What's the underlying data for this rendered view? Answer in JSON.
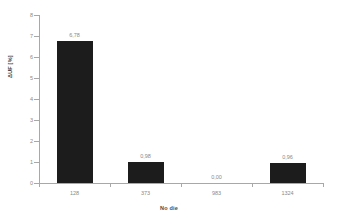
{
  "chart_data": {
    "type": "bar",
    "title": "",
    "subtitle": "",
    "xlabel": "No die",
    "ylabel": "ΔUF [%]",
    "categories": [
      "128",
      "373",
      "983",
      "1324"
    ],
    "values": [
      6.78,
      0.98,
      0.0,
      0.96
    ],
    "data_labels": [
      "6,78",
      "0,98",
      "0,00",
      "0,96"
    ],
    "ylim": [
      0,
      8
    ],
    "yticks": [
      0,
      1,
      2,
      3,
      4,
      5,
      6,
      7,
      8
    ],
    "ytick_labels": [
      "0",
      "1",
      "2",
      "3",
      "4",
      "5",
      "6",
      "7",
      "8"
    ],
    "grid": false,
    "legend": null,
    "legend_position": "none",
    "decimal_separator": ",",
    "bar_color": "#1c1c1c",
    "axis_color": "#a8a8a8",
    "label_color": "#8a8a8a",
    "title_color": "#4a4a4a",
    "background": "#ffffff"
  }
}
